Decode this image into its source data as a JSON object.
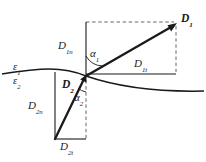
{
  "figure": {
    "canvas": {
      "width": 206,
      "height": 162,
      "background": "#ffffff"
    },
    "stroke_color": "#1a1a1a",
    "labels": {
      "vector_d1": "D",
      "vector_d1_sub": "1",
      "d1_normal": "D",
      "d1_normal_sub": "1n",
      "d1_tangential": "D",
      "d1_tangential_sub": "1t",
      "angle_alpha1": "α",
      "angle_alpha1_sub": "1",
      "permittivity_1": "ε",
      "permittivity_1_sub": "1",
      "permittivity_2": "ε",
      "permittivity_2_sub": "2",
      "vector_d2": "D",
      "vector_d2_sub": "2",
      "d2_normal": "D",
      "d2_normal_sub": "2n",
      "d2_tangential": "D",
      "d2_tangential_sub": "2t",
      "angle_alpha2": "α",
      "angle_alpha2_sub": "2"
    },
    "geometry": {
      "origin": {
        "x": 86,
        "y": 76
      },
      "d1_tip": {
        "x": 176,
        "y": 24
      },
      "d2_tail": {
        "x": 55,
        "y": 139
      },
      "interface_curve": "M 2,74 C 40,68 62,66 86,76 C 118,87 160,92 204,91",
      "upper_rect_top_y": 22,
      "upper_rect_right_x": 176,
      "lower_rect_left_x": 55,
      "lower_rect_bottom_y": 139
    }
  }
}
